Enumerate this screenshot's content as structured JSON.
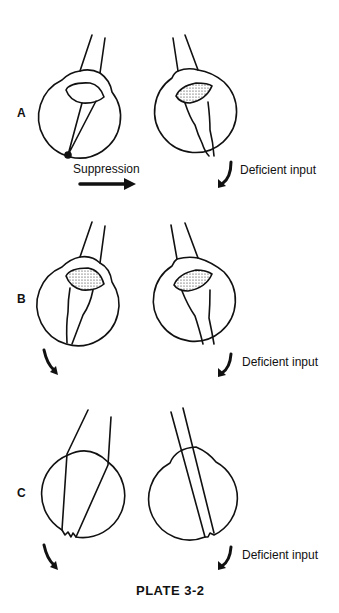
{
  "figure": {
    "caption": "PLATE 3-2",
    "rows": [
      {
        "label": "A",
        "left_annotation": "Suppression",
        "right_annotation": "Deficient input"
      },
      {
        "label": "B",
        "left_annotation": "",
        "right_annotation": "Deficient input"
      },
      {
        "label": "C",
        "left_annotation": "",
        "right_annotation": "Deficient input"
      }
    ]
  },
  "colors": {
    "ink": "#111111",
    "background": "#ffffff"
  }
}
